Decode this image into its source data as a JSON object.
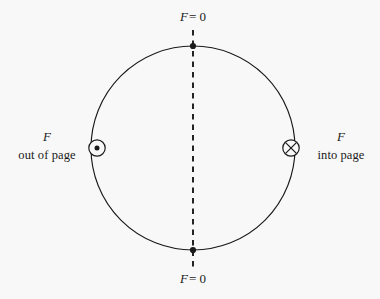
{
  "figure": {
    "background_color": "#f8f8f8",
    "stroke_color": "#1a1a1a",
    "circle": {
      "center_x": 193,
      "center_y": 148,
      "radius": 102
    },
    "dashed_axis": {
      "x": 193,
      "y_start": 30,
      "y_end": 268
    },
    "labels": {
      "top": {
        "symbol": "F",
        "equals": "= 0"
      },
      "bottom": {
        "symbol": "F",
        "equals": "= 0"
      },
      "left": {
        "symbol": "F",
        "text": "out of page"
      },
      "right": {
        "symbol": "F",
        "text": "into page"
      }
    },
    "markers": {
      "top_point": {
        "x": 193,
        "y": 46,
        "kind": "filled-dot"
      },
      "bottom_point": {
        "x": 193,
        "y": 250,
        "kind": "filled-dot"
      },
      "left_symbol": {
        "x": 97,
        "y": 148,
        "kind": "circle-dot",
        "meaning": "out of page"
      },
      "right_symbol": {
        "x": 291,
        "y": 148,
        "kind": "circle-cross",
        "meaning": "into page"
      }
    }
  }
}
